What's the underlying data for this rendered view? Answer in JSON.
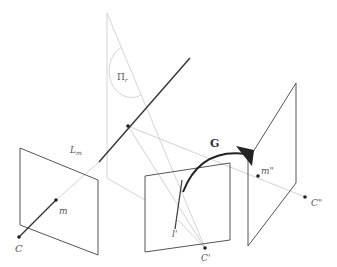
{
  "diagram": {
    "type": "multi-view geometry illustration",
    "labels": {
      "camera_center_1": "C",
      "camera_center_2": "C'",
      "camera_center_3": "C\"",
      "image_point_1": "m",
      "image_point_3": "m\"",
      "back_projected_line": "L",
      "back_projected_line_sub": "m",
      "image_line_2": "l'",
      "plane": "Π",
      "plane_sub": "r",
      "transfer": "G"
    },
    "colors": {
      "dark_line": "#3a3a3a",
      "light_line": "#c8c8c8",
      "plane_edge": "#555555",
      "label": "#555555"
    }
  }
}
